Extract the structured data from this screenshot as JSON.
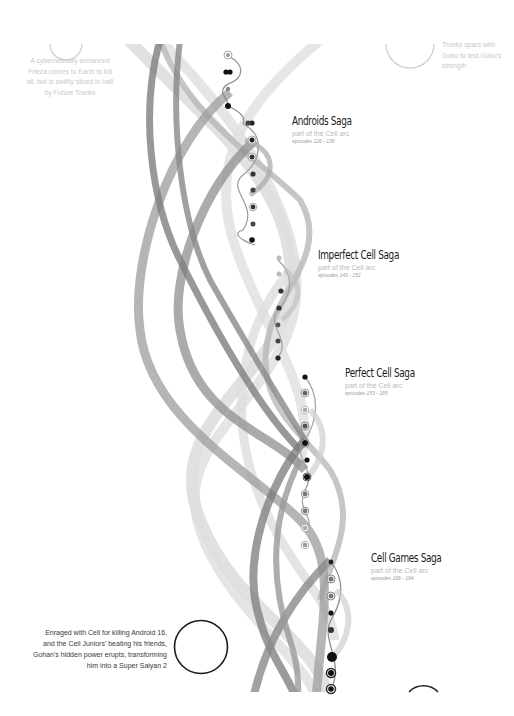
{
  "sagas": [
    {
      "title": "Androids Saga",
      "arc": "part of the Cell arc",
      "episodes": "episodes 126 - 139"
    },
    {
      "title": "Imperfect Cell Saga",
      "arc": "part of the Cell arc",
      "episodes": "episodes 140 - 152"
    },
    {
      "title": "Perfect Cell Saga",
      "arc": "part of the Cell arc",
      "episodes": "episodes 153 - 165"
    },
    {
      "title": "Cell Games Saga",
      "arc": "part of the Cell arc",
      "episodes": "episodes 166 - 194"
    }
  ],
  "annotations": [
    {
      "lines": [
        "A cybernetically enhanced",
        "Frieza comes to Earth to kill",
        "all, but is swiftly sliced in half",
        "by Future Trunks"
      ]
    },
    {
      "lines": [
        "Trunks spars with",
        "Goku to test Goku's",
        "strength"
      ]
    },
    {
      "lines": [
        "Enraged with Cell for killing Android 16,",
        "and the Cell Juniors' beating his friends,",
        "Gohan's hidden power erupts, transforming",
        "him into a Super Saiyan 2"
      ]
    }
  ],
  "colors": {
    "background": "#ffffff",
    "ribbon_dark": "#8a8a8a",
    "ribbon_mid": "#a9a9a9",
    "ribbon_light": "#d4d4d4",
    "node_dark": "#111111",
    "node_light": "#a0a0a0",
    "callout_faded": "#c9c9c9",
    "callout_dark": "#1a1a1a"
  }
}
